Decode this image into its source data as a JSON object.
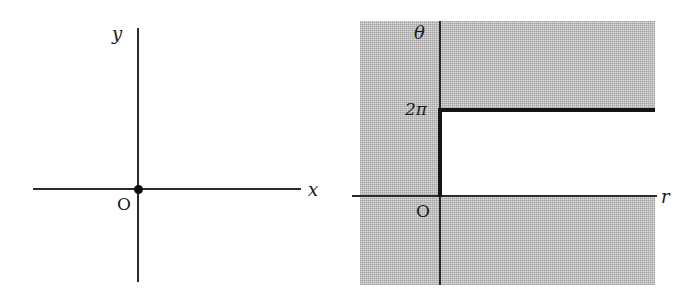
{
  "figure": {
    "width": 696,
    "height": 300,
    "background": "#ffffff",
    "ink_color": "#2b2b2b",
    "shade_color": "#dedede",
    "thick_color": "#141414"
  },
  "panels": [
    {
      "id": "cartesian",
      "name": "xy-plane",
      "axes": {
        "horizontal": {
          "label": "x",
          "style": "italic"
        },
        "vertical": {
          "label": "y",
          "style": "italic"
        }
      },
      "origin": {
        "label": "O",
        "marked": true
      }
    },
    {
      "id": "polar",
      "name": "r-theta-plane",
      "axes": {
        "horizontal": {
          "label": "r",
          "style": "italic"
        },
        "vertical": {
          "label": "θ",
          "style": "italic"
        }
      },
      "origin": {
        "label": "O",
        "marked": false
      },
      "ticks": [
        {
          "axis": "vertical",
          "label": "2π",
          "value": 6.283185
        }
      ],
      "region": {
        "description": "unshaded strip",
        "r_range": "r > 0",
        "theta_range": "0 < θ < 2π"
      }
    }
  ]
}
